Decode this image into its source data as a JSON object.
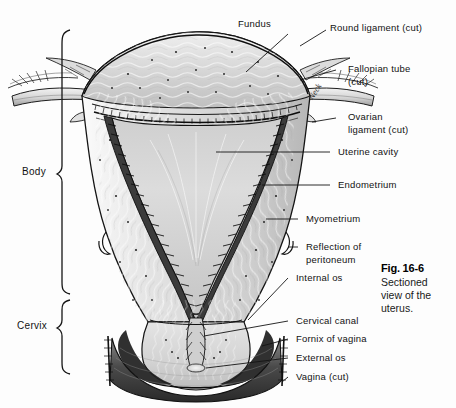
{
  "figure": {
    "caption_title": "Fig. 16-6",
    "caption_body": "Sectioned view of the uterus.",
    "caption_line1": "Sectioned",
    "caption_line2": "view of the",
    "caption_line3": "uterus."
  },
  "brackets": [
    {
      "name": "body",
      "label": "Body"
    },
    {
      "name": "cervix",
      "label": "Cervix"
    }
  ],
  "labels": [
    {
      "name": "fundus",
      "text": "Fundus"
    },
    {
      "name": "round-ligament",
      "text": "Round ligament (cut)"
    },
    {
      "name": "fallopian-tube",
      "text": "Fallopian tube"
    },
    {
      "name": "fallopian-tube-cut",
      "text": "(cut)"
    },
    {
      "name": "ovarian-ligament",
      "text": "Ovarian"
    },
    {
      "name": "ovarian-ligament-cut",
      "text": "ligament (cut)"
    },
    {
      "name": "neck",
      "text": "Neck"
    },
    {
      "name": "uterine-cavity",
      "text": "Uterine cavity"
    },
    {
      "name": "endometrium",
      "text": "Endometrium"
    },
    {
      "name": "myometrium",
      "text": "Myometrium"
    },
    {
      "name": "reflection-of-peritoneum-1",
      "text": "Reflection of"
    },
    {
      "name": "reflection-of-peritoneum-2",
      "text": "peritoneum"
    },
    {
      "name": "internal-os",
      "text": "Internal os"
    },
    {
      "name": "cervical-canal",
      "text": "Cervical canal"
    },
    {
      "name": "fornix-of-vagina",
      "text": "Fornix of vagina"
    },
    {
      "name": "external-os",
      "text": "External os"
    },
    {
      "name": "vagina-cut",
      "text": "Vagina (cut)"
    }
  ],
  "colors": {
    "background": "#fdfdfd",
    "ink": "#121212",
    "leader_line": "#1a1a1a",
    "tissue_light": "#e6e6e6",
    "tissue_mid": "#c9c9c9",
    "tissue_dark": "#8f8f8f",
    "cavity": "#d8d8d8",
    "shadow": "#2b2b2b"
  }
}
